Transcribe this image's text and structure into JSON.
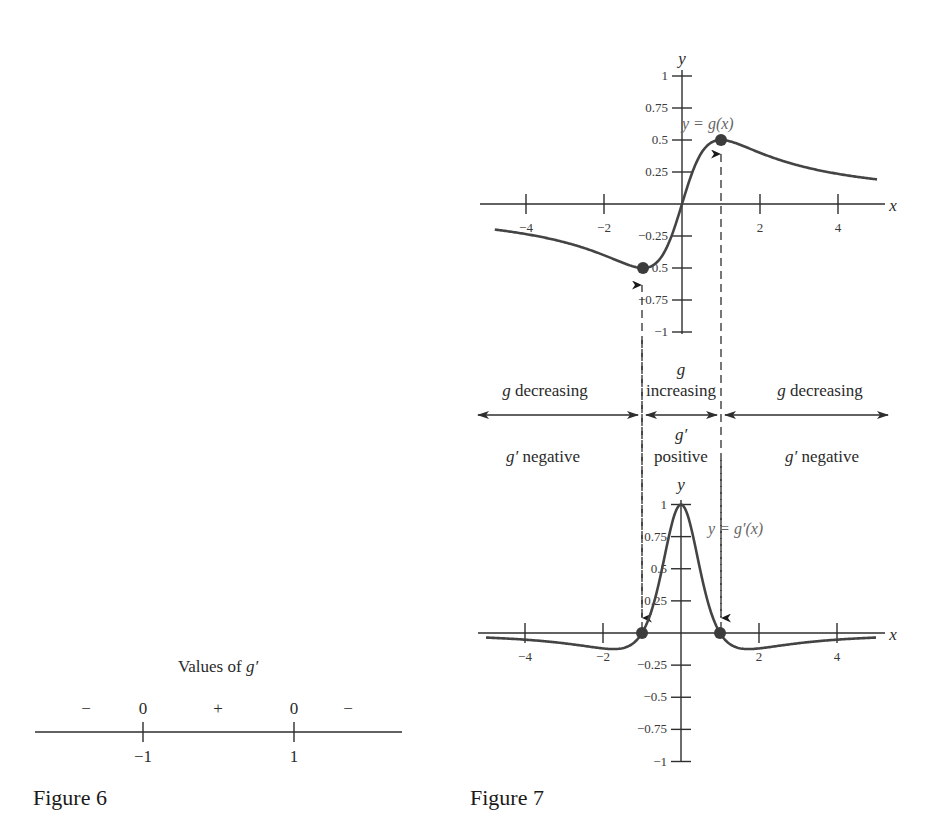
{
  "chart_data": [
    {
      "id": "figure-6",
      "type": "number-line",
      "title": "Values of g′",
      "caption": "Figure 6",
      "points": [
        {
          "x": -1,
          "label": "−1",
          "value_label": "0"
        },
        {
          "x": 1,
          "label": "1",
          "value_label": "0"
        }
      ],
      "sign_labels": [
        {
          "region": "x < -1",
          "sign": "−"
        },
        {
          "region": "-1 < x < 1",
          "sign": "+"
        },
        {
          "region": "x > 1",
          "sign": "−"
        }
      ]
    },
    {
      "id": "figure-7-top",
      "type": "line",
      "caption": "Figure 7",
      "function_label": "y = g(x)",
      "formula": "x/(1+x^2)",
      "xlabel": "x",
      "ylabel": "y",
      "xlim": [
        -5,
        5
      ],
      "ylim": [
        -1,
        1
      ],
      "x_ticks": [
        -4,
        -2,
        2,
        4
      ],
      "x_tick_labels": [
        "−4",
        "−2",
        "2",
        "4"
      ],
      "y_ticks": [
        1,
        0.75,
        0.5,
        0.25,
        -0.25,
        -0.5,
        -0.75,
        -1
      ],
      "y_tick_labels": [
        "1",
        "0.75",
        "0.5",
        "0.25",
        "−0.25",
        "−0.5",
        "−0.75",
        "−1"
      ],
      "x": [
        -4.8,
        -4,
        -3,
        -2,
        -1.5,
        -1,
        -0.5,
        0,
        0.5,
        1,
        1.5,
        2,
        3,
        4,
        5
      ],
      "y": [
        -0.199,
        -0.235,
        -0.3,
        -0.4,
        -0.462,
        -0.5,
        -0.4,
        0,
        0.4,
        0.5,
        0.462,
        0.4,
        0.3,
        0.235,
        0.192
      ],
      "marked_points": [
        {
          "x": -1,
          "y": -0.5,
          "note": "local minimum"
        },
        {
          "x": 1,
          "y": 0.5,
          "note": "local maximum"
        }
      ]
    },
    {
      "id": "figure-7-bottom",
      "type": "line",
      "caption": "Figure 7",
      "function_label": "y = g′(x)",
      "formula": "(1-x^2)/(1+x^2)^2",
      "xlabel": "x",
      "ylabel": "y",
      "xlim": [
        -5,
        5
      ],
      "ylim": [
        -1,
        1
      ],
      "x_ticks": [
        -4,
        -2,
        2,
        4
      ],
      "x_tick_labels": [
        "−4",
        "−2",
        "2",
        "4"
      ],
      "y_ticks": [
        1,
        0.75,
        0.5,
        0.25,
        -0.25,
        -0.5,
        -0.75,
        -1
      ],
      "y_tick_labels": [
        "1",
        "0.75",
        "0.5",
        "0.25",
        "−0.25",
        "−0.5",
        "−0.75",
        "−1"
      ],
      "x": [
        -5,
        -4,
        -3,
        -2,
        -1.732,
        -1.5,
        -1,
        -0.5,
        0,
        0.5,
        1,
        1.5,
        1.732,
        2,
        3,
        4,
        5
      ],
      "y": [
        -0.036,
        -0.052,
        -0.08,
        -0.12,
        -0.125,
        -0.118,
        0,
        0.48,
        1,
        0.48,
        0,
        -0.118,
        -0.125,
        -0.12,
        -0.08,
        -0.052,
        -0.036
      ],
      "marked_points": [
        {
          "x": -1,
          "y": 0
        },
        {
          "x": 1,
          "y": 0
        }
      ]
    }
  ],
  "figure6": {
    "title_prefix": "Values of ",
    "title_var": "g′",
    "signs": [
      "−",
      "0",
      "+",
      "0",
      "−"
    ],
    "tick_labels": [
      "−1",
      "1"
    ],
    "caption": "Figure 6"
  },
  "figure7": {
    "caption": "Figure 7",
    "top_fn_label": "y = g(x)",
    "bottom_fn_label": "y = g′(x)",
    "axis_x": "x",
    "axis_y": "y",
    "regions": {
      "left_top": "g decreasing",
      "mid_top_1": "g",
      "mid_top_2": "increasing",
      "right_top": "g decreasing",
      "left_bottom": "g′ negative",
      "mid_bottom_1": "g′",
      "mid_bottom_2": "positive",
      "right_bottom": "g′ negative"
    }
  },
  "colors": {
    "curve": "#444444",
    "axis": "#2e2e2e",
    "dot": "#3c3c3c",
    "function_label": "#666666"
  }
}
